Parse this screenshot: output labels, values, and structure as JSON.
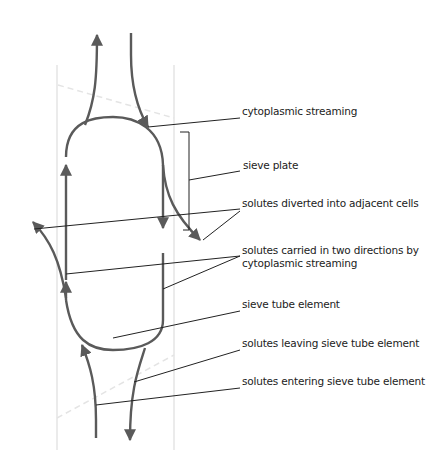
{
  "diagram": {
    "colors": {
      "flow": "#5a5a5a",
      "leader": "#222222",
      "cell_wall": "#e4e4e4",
      "text": "#222222",
      "background": "#ffffff"
    },
    "labels": [
      {
        "id": "cytoplasmic-streaming",
        "text": "cytoplasmic streaming",
        "x": 242,
        "y": 111
      },
      {
        "id": "sieve-plate",
        "text": "sieve plate",
        "x": 243,
        "y": 165
      },
      {
        "id": "solutes-diverted",
        "text": "solutes diverted into adjacent cells",
        "x": 242,
        "y": 203
      },
      {
        "id": "solutes-two-directions-1",
        "text": "solutes carried in two directions by",
        "x": 242,
        "y": 250
      },
      {
        "id": "solutes-two-directions-2",
        "text": "cytoplasmic streaming",
        "x": 242,
        "y": 263
      },
      {
        "id": "sieve-tube-element",
        "text": "sieve tube element",
        "x": 242,
        "y": 304
      },
      {
        "id": "solutes-leaving",
        "text": "solutes leaving sieve tube element",
        "x": 242,
        "y": 343
      },
      {
        "id": "solutes-entering",
        "text": "solutes entering sieve tube element",
        "x": 242,
        "y": 381
      }
    ]
  }
}
